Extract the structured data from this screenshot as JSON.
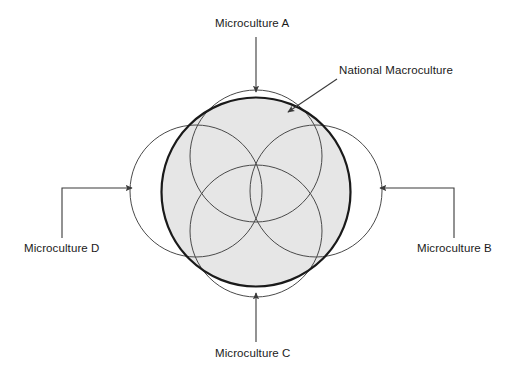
{
  "diagram": {
    "canvas": {
      "width": 512,
      "height": 378,
      "background": "#ffffff"
    },
    "macroculture": {
      "label": "National Macroculture",
      "shape": "circle",
      "center": [
        256,
        192
      ],
      "radius": 95,
      "fill_color": "#e6e6e6",
      "stroke_color": "#1a1a1a",
      "stroke_width": 2.2
    },
    "microcultures": [
      {
        "id": "a",
        "label": "Microculture A",
        "position": "top",
        "shape": "circle",
        "center": [
          256,
          156
        ],
        "radius": 66,
        "stroke_color": "#4a4a4a",
        "stroke_width": 1,
        "fill": "none"
      },
      {
        "id": "b",
        "label": "Microculture B",
        "position": "right",
        "shape": "circle",
        "center": [
          316,
          191
        ],
        "radius": 66,
        "stroke_color": "#4a4a4a",
        "stroke_width": 1,
        "fill": "none"
      },
      {
        "id": "c",
        "label": "Microculture C",
        "position": "bottom",
        "shape": "circle",
        "center": [
          256,
          231
        ],
        "radius": 66,
        "stroke_color": "#4a4a4a",
        "stroke_width": 1,
        "fill": "none"
      },
      {
        "id": "d",
        "label": "Microculture D",
        "position": "left",
        "shape": "circle",
        "center": [
          196,
          191
        ],
        "radius": 66,
        "stroke_color": "#4a4a4a",
        "stroke_width": 1,
        "fill": "none"
      }
    ],
    "connectors": [
      {
        "id": "a",
        "for": "Microculture A",
        "style": "straight-vertical",
        "points": "256,37 256,92",
        "arrow": "down",
        "color": "#3a3a3a"
      },
      {
        "id": "b",
        "for": "Microculture B",
        "style": "elbow",
        "points": "454,238 454,188 379,188",
        "arrow": "left",
        "color": "#3a3a3a"
      },
      {
        "id": "c",
        "for": "Microculture C",
        "style": "straight-vertical",
        "points": "256,342 256,292",
        "arrow": "up",
        "color": "#3a3a3a"
      },
      {
        "id": "d",
        "for": "Microculture D",
        "style": "elbow",
        "points": "62,238 62,188 133,188",
        "arrow": "right",
        "color": "#3a3a3a"
      },
      {
        "id": "macro",
        "for": "National Macroculture",
        "style": "diagonal",
        "points": "337,79 287,113",
        "arrow": "down-left",
        "color": "#3a3a3a"
      }
    ]
  }
}
